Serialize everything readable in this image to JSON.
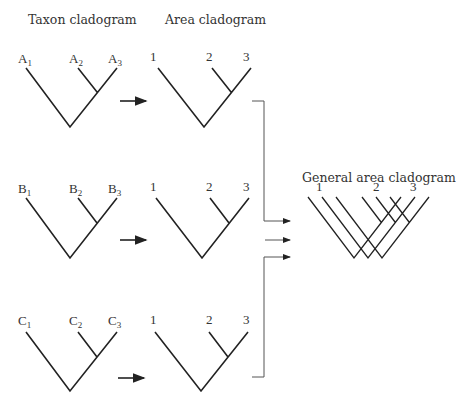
{
  "titles": {
    "taxon": "Taxon cladogram",
    "area": "Area cladogram",
    "general": "General area cladogram"
  },
  "taxon_trees": [
    {
      "letter": "A",
      "labels": [
        "A",
        "A",
        "A"
      ],
      "subs": [
        "1",
        "2",
        "3"
      ]
    },
    {
      "letter": "B",
      "labels": [
        "B",
        "B",
        "B"
      ],
      "subs": [
        "1",
        "2",
        "3"
      ]
    },
    {
      "letter": "C",
      "labels": [
        "C",
        "C",
        "C"
      ],
      "subs": [
        "1",
        "2",
        "3"
      ]
    }
  ],
  "area_labels": [
    "1",
    "2",
    "3"
  ],
  "general_labels": [
    "1",
    "2",
    "3"
  ],
  "icons": {
    "arrow": "right-arrow-icon"
  }
}
